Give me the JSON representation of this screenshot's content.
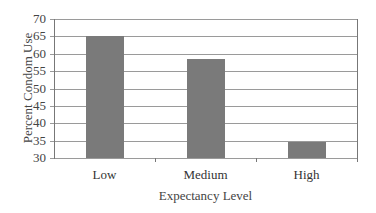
{
  "chart_data": {
    "type": "bar",
    "title": "",
    "xlabel": "Expectancy Level",
    "ylabel": "Percent Condom Use",
    "categories": [
      "Low",
      "Medium",
      "High"
    ],
    "values": [
      65,
      58.5,
      34.5
    ],
    "ylim": [
      30,
      70
    ],
    "yticks": [
      30,
      35,
      40,
      45,
      50,
      55,
      60,
      65,
      70
    ],
    "grid": true,
    "legend": "none",
    "bar_color": "#7a7a7a"
  }
}
